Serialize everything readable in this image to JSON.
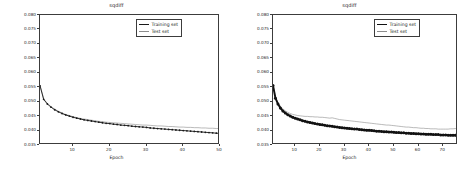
{
  "figure": {
    "background": "#ffffff",
    "panel_count": 2
  },
  "chart_data": [
    {
      "panel": "left",
      "type": "line",
      "title": "sqdiff",
      "xlabel": "Epoch",
      "ylabel": "",
      "xlim": [
        1,
        50
      ],
      "ylim": [
        0.035,
        0.08
      ],
      "xticks": [
        10,
        20,
        30,
        40,
        50
      ],
      "yticks": [
        "0.035",
        "0.040",
        "0.045",
        "0.050",
        "0.055",
        "0.060",
        "0.065",
        "0.070",
        "0.075",
        "0.080"
      ],
      "ytick_values": [
        0.035,
        0.04,
        0.045,
        0.05,
        0.055,
        0.06,
        0.065,
        0.07,
        0.075,
        0.08
      ],
      "grid": false,
      "legend_position": "upper right",
      "legend": [
        "Training set",
        "Test set"
      ],
      "colors": {
        "training": "#1a1a1a",
        "test": "#8c8c8c"
      },
      "x": [
        1,
        2,
        3,
        4,
        5,
        6,
        7,
        8,
        9,
        10,
        11,
        12,
        13,
        14,
        15,
        16,
        17,
        18,
        19,
        20,
        21,
        22,
        23,
        24,
        25,
        26,
        27,
        28,
        29,
        30,
        31,
        32,
        33,
        34,
        35,
        36,
        37,
        38,
        39,
        40,
        41,
        42,
        43,
        44,
        45,
        46,
        47,
        48,
        49,
        50
      ],
      "series": [
        {
          "name": "Training set",
          "values": [
            0.0555,
            0.0508,
            0.0492,
            0.0481,
            0.0472,
            0.0465,
            0.0459,
            0.0454,
            0.045,
            0.0446,
            0.0443,
            0.044,
            0.0437,
            0.0435,
            0.0433,
            0.0431,
            0.0429,
            0.0427,
            0.0425,
            0.0424,
            0.0422,
            0.0421,
            0.0419,
            0.0418,
            0.0417,
            0.0415,
            0.0414,
            0.0413,
            0.0412,
            0.0411,
            0.0409,
            0.0408,
            0.0407,
            0.0406,
            0.0405,
            0.0404,
            0.0403,
            0.0402,
            0.0401,
            0.04,
            0.0399,
            0.0398,
            0.0397,
            0.0396,
            0.0395,
            0.0394,
            0.0393,
            0.0392,
            0.0391,
            0.039
          ]
        },
        {
          "name": "Test set",
          "values": [
            0.0558,
            0.051,
            0.0494,
            0.0483,
            0.0474,
            0.0467,
            0.0461,
            0.0456,
            0.0452,
            0.0448,
            0.0445,
            0.0442,
            0.044,
            0.0438,
            0.0436,
            0.0434,
            0.0432,
            0.0431,
            0.0429,
            0.0428,
            0.0427,
            0.0426,
            0.0425,
            0.0424,
            0.0423,
            0.0422,
            0.0421,
            0.042,
            0.0419,
            0.0419,
            0.0418,
            0.0417,
            0.0416,
            0.0416,
            0.0415,
            0.0414,
            0.0414,
            0.0413,
            0.0412,
            0.0412,
            0.0411,
            0.0411,
            0.041,
            0.041,
            0.0409,
            0.0409,
            0.0408,
            0.0408,
            0.0407,
            0.0407
          ]
        }
      ]
    },
    {
      "panel": "right",
      "type": "line",
      "title": "sqdiff",
      "xlabel": "Epoch",
      "ylabel": "",
      "xlim": [
        1,
        76
      ],
      "ylim": [
        0.035,
        0.08
      ],
      "xticks": [
        10,
        20,
        30,
        40,
        50,
        60,
        70
      ],
      "yticks": [
        "0.035",
        "0.040",
        "0.045",
        "0.050",
        "0.055",
        "0.060",
        "0.065",
        "0.070",
        "0.075",
        "0.080"
      ],
      "ytick_values": [
        0.035,
        0.04,
        0.045,
        0.05,
        0.055,
        0.06,
        0.065,
        0.07,
        0.075,
        0.08
      ],
      "grid": false,
      "legend_position": "upper right",
      "legend": [
        "Training set",
        "Test set"
      ],
      "colors": {
        "training": "#111111",
        "test": "#8c8c8c"
      },
      "x": [
        1,
        2,
        3,
        4,
        5,
        6,
        7,
        8,
        9,
        10,
        11,
        12,
        13,
        14,
        15,
        16,
        17,
        18,
        19,
        20,
        21,
        22,
        23,
        24,
        25,
        26,
        27,
        28,
        29,
        30,
        31,
        32,
        33,
        34,
        35,
        36,
        37,
        38,
        39,
        40,
        41,
        42,
        43,
        44,
        45,
        46,
        47,
        48,
        49,
        50,
        51,
        52,
        53,
        54,
        55,
        56,
        57,
        58,
        59,
        60,
        61,
        62,
        63,
        64,
        65,
        66,
        67,
        68,
        69,
        70,
        71,
        72,
        73,
        74,
        75,
        76
      ],
      "series": [
        {
          "name": "Training set",
          "values": [
            0.0556,
            0.0512,
            0.0492,
            0.0478,
            0.0468,
            0.0461,
            0.0455,
            0.045,
            0.0446,
            0.0443,
            0.044,
            0.0437,
            0.0434,
            0.0432,
            0.043,
            0.0428,
            0.0426,
            0.0424,
            0.0423,
            0.0421,
            0.042,
            0.0418,
            0.0417,
            0.0416,
            0.0415,
            0.0413,
            0.0412,
            0.0411,
            0.041,
            0.0409,
            0.0408,
            0.0407,
            0.0406,
            0.0405,
            0.0405,
            0.0404,
            0.0403,
            0.0402,
            0.0401,
            0.0401,
            0.04,
            0.0399,
            0.0398,
            0.0398,
            0.0397,
            0.0396,
            0.0396,
            0.0395,
            0.0395,
            0.0394,
            0.0393,
            0.0393,
            0.0392,
            0.0392,
            0.0391,
            0.0391,
            0.039,
            0.039,
            0.0389,
            0.0389,
            0.0388,
            0.0388,
            0.0387,
            0.0387,
            0.0387,
            0.0386,
            0.0386,
            0.0386,
            0.0385,
            0.0385,
            0.0385,
            0.0384,
            0.0384,
            0.0384,
            0.0384,
            0.0383
          ]
        },
        {
          "name": "Test set",
          "values": [
            0.056,
            0.0516,
            0.0497,
            0.0484,
            0.0475,
            0.0468,
            0.0463,
            0.0459,
            0.0456,
            0.0454,
            0.0452,
            0.0451,
            0.045,
            0.0449,
            0.0449,
            0.0448,
            0.0448,
            0.0447,
            0.0447,
            0.0446,
            0.0446,
            0.0445,
            0.0444,
            0.0443,
            0.0444,
            0.0442,
            0.044,
            0.0438,
            0.0437,
            0.0436,
            0.0435,
            0.0434,
            0.0433,
            0.0432,
            0.0431,
            0.043,
            0.0429,
            0.0428,
            0.0427,
            0.0426,
            0.0425,
            0.0424,
            0.0423,
            0.0422,
            0.0421,
            0.042,
            0.0419,
            0.0419,
            0.0418,
            0.0417,
            0.0416,
            0.0415,
            0.0414,
            0.0413,
            0.0412,
            0.0412,
            0.0411,
            0.041,
            0.041,
            0.0409,
            0.0408,
            0.0408,
            0.0407,
            0.0407,
            0.0406,
            0.0406,
            0.0406,
            0.0405,
            0.0405,
            0.0405,
            0.0405,
            0.0405,
            0.0406,
            0.0406,
            0.0407,
            0.0408
          ]
        }
      ]
    }
  ]
}
